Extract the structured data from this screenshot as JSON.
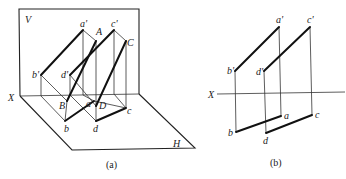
{
  "figure_a": {
    "caption": "(a)",
    "planes": {
      "V": "V",
      "H": "H",
      "axis": "X"
    },
    "points": {
      "a_prime": "a'",
      "c_prime": "c'",
      "b_prime": "b'",
      "d_prime": "d'",
      "A": "A",
      "C": "C",
      "B": "B",
      "D": "D",
      "a": "a",
      "b": "b",
      "c": "c",
      "d": "d"
    }
  },
  "figure_b": {
    "caption": "(b)",
    "axis": "X",
    "points": {
      "a_prime": "a'",
      "c_prime": "c'",
      "b_prime": "b'",
      "d_prime": "d'",
      "a": "a",
      "b": "b",
      "c": "c",
      "d": "d"
    }
  },
  "colors": {
    "line": "#111111",
    "background": "#ffffff"
  }
}
